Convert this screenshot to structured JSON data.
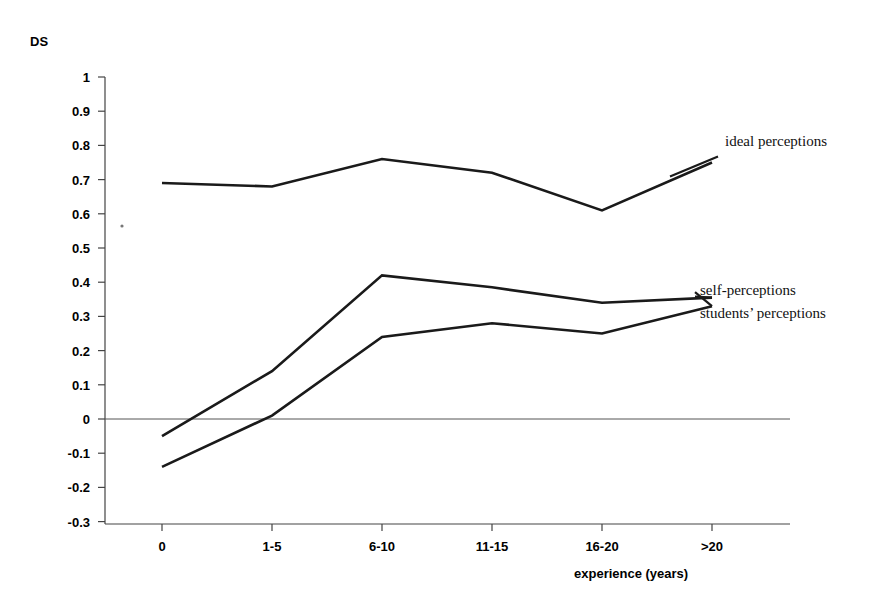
{
  "chart_data": {
    "type": "line",
    "title": "",
    "ylabel": "DS",
    "xlabel": "experience (years)",
    "categories": [
      "0",
      "1-5",
      "6-10",
      "11-15",
      "16-20",
      ">20"
    ],
    "ylim": [
      -0.3,
      1
    ],
    "ytick_labels": [
      "1",
      "0.9",
      "0.8",
      "0.7",
      "0.6",
      "0.5",
      "0.4",
      "0.3",
      "0.2",
      "0.1",
      "0",
      "-0.1",
      "-0.2",
      "-0.3"
    ],
    "ytick_values": [
      1,
      0.9,
      0.8,
      0.7,
      0.6,
      0.5,
      0.4,
      0.3,
      0.2,
      0.1,
      0,
      -0.1,
      -0.2,
      -0.3
    ],
    "grid": false,
    "legend_position": "inline-right",
    "zero_reference_line": true,
    "series": [
      {
        "name": "ideal perceptions",
        "label": "ideal perceptions",
        "values": [
          0.69,
          0.68,
          0.76,
          0.72,
          0.61,
          0.75
        ]
      },
      {
        "name": "self-perceptions",
        "label": "self-perceptions",
        "values": [
          -0.05,
          0.14,
          0.42,
          0.385,
          0.34,
          0.355
        ]
      },
      {
        "name": "students' perceptions",
        "label": "students’ perceptions",
        "values": [
          -0.14,
          0.01,
          0.24,
          0.28,
          0.25,
          0.33
        ]
      }
    ],
    "colors": {
      "line": "#1a1a1a",
      "axis": "#444444",
      "background": "#ffffff",
      "text": "#000000"
    }
  },
  "labels": {
    "y_axis_title": "DS",
    "x_axis_title": "experience (years)"
  }
}
